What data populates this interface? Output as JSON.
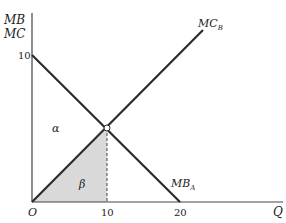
{
  "diagram": {
    "y_axis_label_line1": "MB",
    "y_axis_label_line2": "MC",
    "x_axis_label": "Q",
    "origin_label": "O",
    "y_ticks": [
      "10"
    ],
    "x_ticks": [
      "10",
      "20"
    ],
    "curves": {
      "mc_b": {
        "label_main": "MC",
        "label_sub": "B"
      },
      "mb_a": {
        "label_main": "MB",
        "label_sub": "A"
      }
    },
    "regions": {
      "alpha": "α",
      "beta": "β"
    },
    "colors": {
      "line": "#2b2b2b",
      "shade": "#d9d9d9",
      "text": "#222222"
    }
  }
}
